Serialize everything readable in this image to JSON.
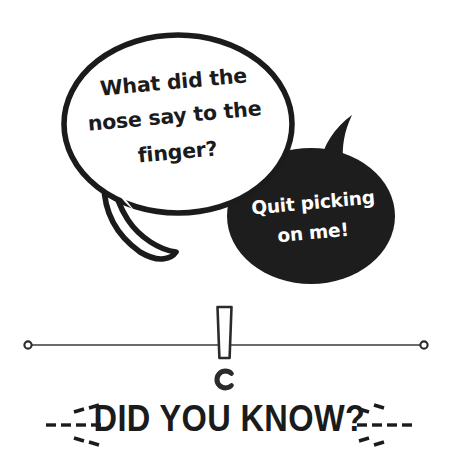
{
  "canvas": {
    "width": 458,
    "height": 453,
    "background_color": "#ffffff"
  },
  "colors": {
    "ink": "#1b1b1b",
    "bubble_fill_dark": "#1d1d1d",
    "bubble_fill_light": "#ffffff",
    "text_on_dark": "#ffffff",
    "rule": "#3a3a3a"
  },
  "question_bubble": {
    "name": "question-speech-bubble",
    "style": "white-ellipse-with-black-outline",
    "text_lines": [
      "What did the",
      "nose say to the",
      "finger?"
    ],
    "full_text": "What did the nose say to the finger?",
    "text_color": "#1b1b1b",
    "tail_direction": "down-left-hook"
  },
  "answer_bubble": {
    "name": "answer-speech-bubble",
    "style": "solid-black-ellipse",
    "text_lines": [
      "Quit picking",
      "on me!"
    ],
    "full_text": "Quit picking on me!",
    "text_color": "#ffffff",
    "tail_direction": "up-right-horn"
  },
  "divider": {
    "name": "exclamation-rule-divider",
    "icon": "exclamation-mark-icon",
    "left_endpoint": "ring",
    "right_endpoint": "ring",
    "line_color": "#3a3a3a"
  },
  "footer": {
    "headline": "DID YOU KNOW?",
    "left_ornament": "dashed-burst-icon",
    "right_ornament": "dashed-burst-icon"
  }
}
